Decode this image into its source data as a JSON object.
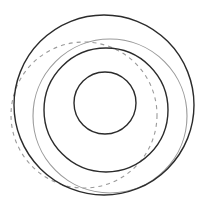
{
  "figure": {
    "title": "",
    "background_color": "#ffffff",
    "width": 209,
    "height": 216
  },
  "chart_data": {
    "type": "diagram",
    "title": "",
    "subtitle": "",
    "xlabel": "",
    "ylabel": "",
    "grid": false,
    "legend": false,
    "axis_visible": false,
    "xlim": [
      0,
      209
    ],
    "ylim": [
      0,
      216
    ],
    "shapes": [
      {
        "name": "outer-circle",
        "shape": "circle",
        "cx": 104,
        "cy": 105,
        "r": 90,
        "stroke": "#2b2b2b",
        "stroke_width": 1.4,
        "dash": "none",
        "fill": "none"
      },
      {
        "name": "medium-circle",
        "shape": "circle",
        "cx": 106,
        "cy": 110,
        "r": 62,
        "stroke": "#2b2b2b",
        "stroke_width": 1.4,
        "dash": "none",
        "fill": "none"
      },
      {
        "name": "inner-circle",
        "shape": "circle",
        "cx": 105,
        "cy": 103,
        "r": 31,
        "stroke": "#2b2b2b",
        "stroke_width": 1.4,
        "dash": "none",
        "fill": "none"
      },
      {
        "name": "gray-solid-circle",
        "shape": "circle",
        "cx": 110,
        "cy": 116,
        "r": 77,
        "stroke": "#9a9a9a",
        "stroke_width": 1.1,
        "dash": "none",
        "fill": "none"
      },
      {
        "name": "gray-dashed-circle",
        "shape": "circle",
        "cx": 84,
        "cy": 115,
        "r": 73,
        "stroke": "#9a9a9a",
        "stroke_width": 1.1,
        "dash": "4 4",
        "fill": "none"
      }
    ],
    "colors": {
      "dark_stroke": "#2b2b2b",
      "gray_stroke": "#9a9a9a",
      "background": "#ffffff"
    }
  }
}
